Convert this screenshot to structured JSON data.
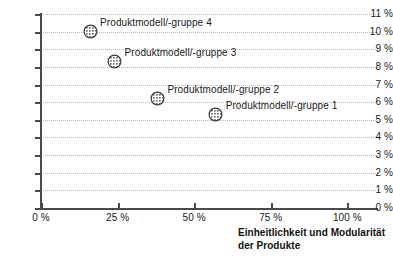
{
  "chart_data": {
    "type": "scatter",
    "title": "",
    "xlabel": "Einheitlichkeit und Modularität der Produkte",
    "ylabel": "",
    "xlim": [
      0,
      110
    ],
    "ylim": [
      0,
      11
    ],
    "grid": "horizontal-dotted",
    "legend": "none",
    "x_ticks": [
      {
        "value": 0,
        "label": "0 %"
      },
      {
        "value": 25,
        "label": "25 %"
      },
      {
        "value": 50,
        "label": "50 %"
      },
      {
        "value": 75,
        "label": "75 %"
      },
      {
        "value": 100,
        "label": "100 %"
      }
    ],
    "y_ticks": [
      {
        "value": 11,
        "label": "11 %"
      },
      {
        "value": 10,
        "label": "10 %"
      },
      {
        "value": 9,
        "label": "9 %"
      },
      {
        "value": 8,
        "label": "8 %"
      },
      {
        "value": 7,
        "label": "7 %"
      },
      {
        "value": 6,
        "label": "6 %"
      },
      {
        "value": 5,
        "label": "5 %"
      },
      {
        "value": 4,
        "label": "4 %"
      },
      {
        "value": 3,
        "label": "3 %"
      },
      {
        "value": 2,
        "label": "2 %"
      },
      {
        "value": 1,
        "label": "1 %"
      },
      {
        "value": 0,
        "label": "0 %"
      }
    ],
    "points": [
      {
        "label": "Produktmodell/-gruppe 4",
        "x": 16,
        "y": 10.0,
        "label_side": "right"
      },
      {
        "label": "Produktmodell/-gruppe 3",
        "x": 24,
        "y": 8.3,
        "label_side": "right"
      },
      {
        "label": "Produktmodell/-gruppe 2",
        "x": 38,
        "y": 6.2,
        "label_side": "right"
      },
      {
        "label": "Produktmodell/-gruppe 1",
        "x": 57,
        "y": 5.3,
        "label_side": "right"
      }
    ],
    "marker_style": {
      "shape": "circle",
      "fill": "checkered-dot-pattern",
      "fill_color": "#8a8a8a",
      "stroke_color": "#3c3c3c",
      "diameter_px": 15
    },
    "colors": {
      "axis": "#4a4a4a",
      "grid": "#b9b9b9",
      "text": "#1a1a1a",
      "background": "#ffffff"
    }
  },
  "axis_title": {
    "line1": "Einheitlichkeit und Modularität",
    "line2": "der Produkte"
  }
}
